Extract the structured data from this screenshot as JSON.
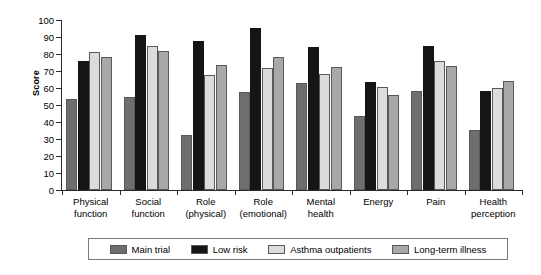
{
  "chart_data": {
    "type": "bar",
    "title": "",
    "xlabel": "",
    "ylabel": "Score",
    "ylim": [
      0,
      100
    ],
    "ytick_values": [
      100,
      90,
      80,
      70,
      60,
      50,
      40,
      30,
      20,
      10,
      0
    ],
    "grid": false,
    "legend_position": "bottom",
    "categories": [
      "Physical\nfunction",
      "Social\nfunction",
      "Role\n(physical)",
      "Role\n(emotional)",
      "Mental\nhealth",
      "Energy",
      "Pain",
      "Health\nperception"
    ],
    "series": [
      {
        "name": "Main trial",
        "color": "#6e6e6e",
        "values": [
          53.5,
          54.5,
          32.5,
          57.5,
          63.0,
          43.5,
          58.0,
          35.5
        ]
      },
      {
        "name": "Low risk",
        "color": "#151515",
        "values": [
          76.0,
          91.0,
          87.5,
          95.5,
          84.0,
          63.5,
          85.0,
          58.5
        ]
      },
      {
        "name": "Asthma outpatients",
        "color": "#dcdcdc",
        "values": [
          81.0,
          85.0,
          67.5,
          72.0,
          68.5,
          60.5,
          76.0,
          60.0
        ]
      },
      {
        "name": "Long-term illness",
        "color": "#a8a8a8",
        "values": [
          78.5,
          81.5,
          73.5,
          78.0,
          72.5,
          56.0,
          73.0,
          64.0
        ]
      }
    ]
  }
}
